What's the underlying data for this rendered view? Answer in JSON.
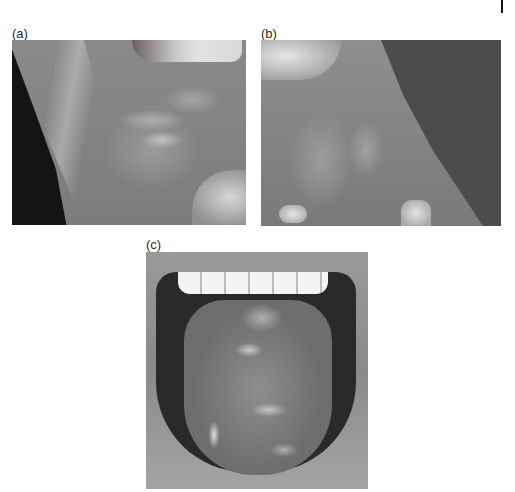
{
  "figure": {
    "panels": [
      {
        "id": "a",
        "label": "(a)",
        "subject": "buccal mucosa with white reticular striae"
      },
      {
        "id": "b",
        "label": "(b)",
        "subject": "buccal mucosa with white lesions"
      },
      {
        "id": "c",
        "label": "(c)",
        "subject": "dorsum of tongue with white plaques"
      }
    ]
  },
  "colors": {
    "background": "#ffffff",
    "label_text": "#2a2a2a"
  }
}
